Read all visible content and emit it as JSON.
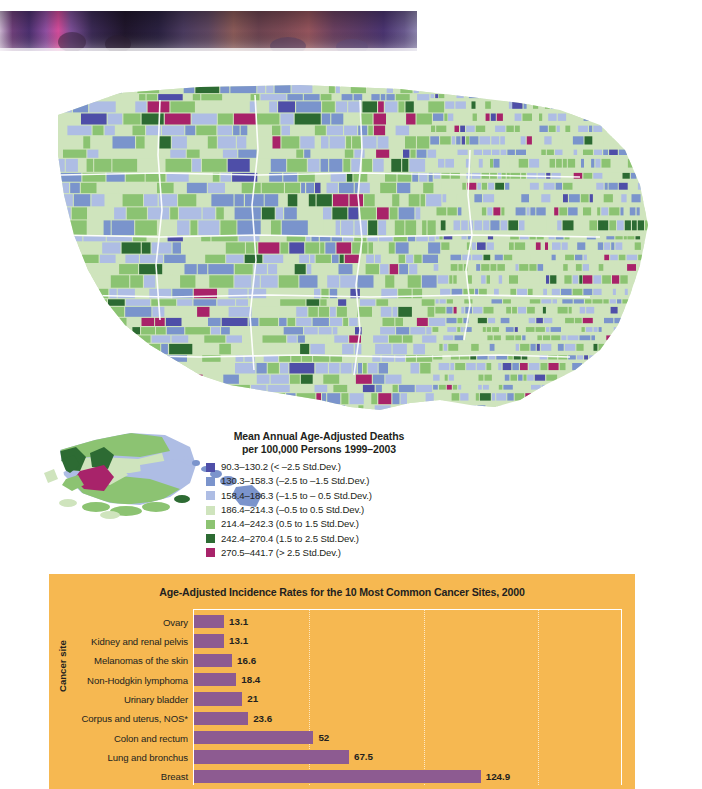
{
  "photo_strip": {
    "name": "photograph-bottom-edge",
    "description": "blurred photograph crop"
  },
  "map": {
    "name": "us-county-choropleth",
    "legend": {
      "title_line1": "Mean Annual Age-Adjusted Deaths",
      "title_line2": "per 100,000 Persons 1999–2003",
      "entries": [
        {
          "label": "90.3–130.2 (< –2.5 Std.Dev.)",
          "color": "#4f4fa8"
        },
        {
          "label": "130.3–158.3  (–2.5 to –1.5 Std.Dev.)",
          "color": "#7b94cc"
        },
        {
          "label": "158.4–186.3  (–1.5 to – 0.5 Std.Dev.)",
          "color": "#aebde4"
        },
        {
          "label": "186.4–214.3 (–0.5 to 0.5 Std.Dev.)",
          "color": "#cfe4bd"
        },
        {
          "label": "214.4–242.3 (0.5 to 1.5 Std.Dev.)",
          "color": "#8cc372"
        },
        {
          "label": "242.4–270.4 (1.5 to 2.5 Std.Dev.)",
          "color": "#2d6b33"
        },
        {
          "label": "270.5–441.7 (> 2.5 Std.Dev.)",
          "color": "#a8236a"
        }
      ]
    }
  },
  "chart_data": {
    "type": "bar",
    "orientation": "horizontal",
    "title": "Age-Adjusted Incidence Rates for the 10 Most Common Cancer Sites, 2000",
    "ylabel": "Cancer site",
    "xlabel": "",
    "categories": [
      "Ovary",
      "Kidney and renal pelvis",
      "Melanomas of the skin",
      "Non-Hodgkin lymphoma",
      "Urinary bladder",
      "Corpus and uterus, NOS*",
      "Colon and rectum",
      "Lung and bronchus",
      "Breast"
    ],
    "values": [
      13.1,
      13.1,
      16.6,
      18.4,
      21,
      23.6,
      52,
      67.5,
      124.9
    ],
    "value_labels": [
      "13.1",
      "13.1",
      "16.6",
      "18.4",
      "21",
      "23.6",
      "52",
      "67.5",
      "124.9"
    ],
    "xlim": [
      0,
      186
    ],
    "gridlines": [
      50,
      100,
      150
    ],
    "grid": true,
    "legend": "none",
    "bar_color": "#8d5b91",
    "panel_color": "#f6b851"
  }
}
